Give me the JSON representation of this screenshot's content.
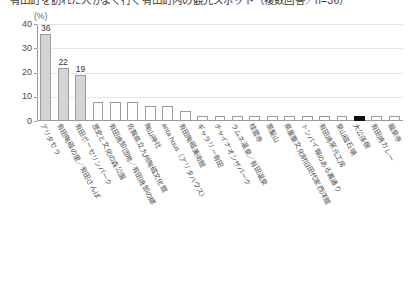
{
  "chart": {
    "title": "有田町を訪れた人がよく行く有田町内の観光スポット（複数回答／n=36）",
    "unit_label": "(%)"
  },
  "chart_data": {
    "type": "bar",
    "title": "有田町を訪れた人がよく行く有田町内の観光スポット（複数回答／n=36）",
    "xlabel": "",
    "ylabel": "(%)",
    "ylim": [
      0,
      40
    ],
    "yticks": [
      0,
      10,
      20,
      30,
      40
    ],
    "grid": true,
    "legend": "none",
    "value_labels_shown": [
      36,
      22,
      19
    ],
    "categories": [
      "アリタセラ",
      "有田陶磁の里／有田さんぽ",
      "有田ポーセリンパーク",
      "歴史と文化の森公園",
      "有田焼卸団地／有田焼卸の郷",
      "佐賀県立九州陶磁文化館",
      "陶山神社",
      "arita huus（アリタハウス）",
      "有田陶磁美術館",
      "ギャラリー有田",
      "チャイナオンザパーク",
      "ラムネ温泉／有田温泉",
      "桂雲寺",
      "黒髪山",
      "県重要文化財旧田代家西洋館",
      "トンバイ塀のある裏通り",
      "有田焼窯元工房",
      "泉山磁石場",
      "大公孫樹",
      "有田焼カレー",
      "龍泉寺"
    ],
    "values": [
      36,
      22,
      19,
      8,
      8,
      8,
      6,
      6,
      4,
      2,
      2,
      2,
      2,
      2,
      2,
      2,
      2,
      2,
      2,
      2,
      2
    ],
    "bar_styles": [
      "gray",
      "gray",
      "gray",
      "white",
      "white",
      "white",
      "white",
      "white",
      "white",
      "white",
      "white",
      "white",
      "white",
      "white",
      "white",
      "white",
      "white",
      "white",
      "black",
      "white",
      "white"
    ],
    "colors": {
      "gray_fill": "#d4d4d4",
      "white_fill": "#ffffff",
      "black_fill": "#0d0d0d",
      "bar_border": "#9c9c9c",
      "gridline": "#e6e6e6",
      "axis": "#9a9a9a"
    }
  }
}
